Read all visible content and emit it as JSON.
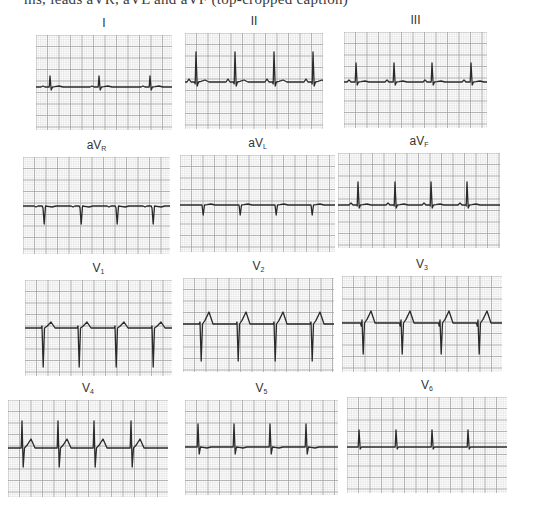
{
  "page": {
    "cut_text": "ms, leads aVR, aVL and aVF (top-cropped caption)"
  },
  "grid": {
    "minor_color": "#dcdcdc",
    "major_color": "#9c9c9c",
    "trace_color": "#2a2a2a",
    "minor_px": 2.3,
    "major_px": 11.5
  },
  "chart_data": {
    "type": "line",
    "xlabel": "time",
    "ylabel": "voltage",
    "grid": true,
    "layout": "4 rows x 3 columns",
    "leads": [
      {
        "id": "I",
        "label_main": "I",
        "label_sub": "",
        "box": [
          36,
          35,
          136,
          95
        ],
        "baseline": 52,
        "beats_x": [
          14,
          63,
          114,
          167
        ],
        "q": 0,
        "r": -11,
        "s": 3,
        "t": -1,
        "p": -1
      },
      {
        "id": "II",
        "label_main": "II",
        "label_sub": "",
        "box": [
          185,
          33,
          138,
          96
        ],
        "baseline": 49,
        "beats_x": [
          11,
          50,
          89,
          128
        ],
        "q": 2,
        "r": -30,
        "s": 4,
        "t": -2,
        "p": -3
      },
      {
        "id": "III",
        "label_main": "III",
        "label_sub": "",
        "box": [
          344,
          32,
          143,
          96
        ],
        "baseline": 50,
        "beats_x": [
          12,
          50,
          88,
          127
        ],
        "q": 0,
        "r": -19,
        "s": 3,
        "t": -1,
        "p": -2
      },
      {
        "id": "aVR",
        "label_main": "aV",
        "label_sub": "R",
        "box": [
          23,
          157,
          147,
          97
        ],
        "baseline": 49,
        "beats_x": [
          20,
          57,
          93,
          129
        ],
        "q": 0,
        "r": 2,
        "s": 18,
        "t": 1,
        "p": 1
      },
      {
        "id": "aVL",
        "label_main": "aV",
        "label_sub": "L",
        "box": [
          180,
          155,
          155,
          97
        ],
        "baseline": 50,
        "beats_x": [
          22,
          59,
          95,
          131
        ],
        "q": 0,
        "r": 0,
        "s": 10,
        "t": -1,
        "p": 0
      },
      {
        "id": "aVF",
        "label_main": "aV",
        "label_sub": "F",
        "box": [
          338,
          153,
          162,
          95
        ],
        "baseline": 52,
        "beats_x": [
          20,
          57,
          93,
          129
        ],
        "q": 1,
        "r": -23,
        "s": 3,
        "t": -1,
        "p": -2
      },
      {
        "id": "V1",
        "label_main": "V",
        "label_sub": "1",
        "box": [
          25,
          280,
          147,
          96
        ],
        "baseline": 48,
        "beats_x": [
          17,
          53,
          90,
          127
        ],
        "q": 0,
        "r": -2,
        "s": 39,
        "t": -6,
        "p": 0
      },
      {
        "id": "V2",
        "label_main": "V",
        "label_sub": "2",
        "box": [
          183,
          278,
          151,
          94
        ],
        "baseline": 46,
        "beats_x": [
          17,
          54,
          91,
          128
        ],
        "q": 0,
        "r": -2,
        "s": 37,
        "t": -12,
        "p": 0
      },
      {
        "id": "V3",
        "label_main": "V",
        "label_sub": "3",
        "box": [
          342,
          276,
          160,
          96
        ],
        "baseline": 47,
        "beats_x": [
          20,
          59,
          98,
          136
        ],
        "q": 3,
        "r": -3,
        "s": 31,
        "t": -12,
        "p": 0
      },
      {
        "id": "V4",
        "label_main": "V",
        "label_sub": "4",
        "box": [
          8,
          400,
          160,
          97
        ],
        "baseline": 48,
        "beats_x": [
          14,
          50,
          86,
          123
        ],
        "q": 0,
        "r": -27,
        "s": 19,
        "t": -9,
        "p": 0
      },
      {
        "id": "V5",
        "label_main": "V",
        "label_sub": "5",
        "box": [
          185,
          400,
          153,
          95
        ],
        "baseline": 47,
        "beats_x": [
          13,
          49,
          85,
          121
        ],
        "q": 0,
        "r": -23,
        "s": 7,
        "t": 1,
        "p": 0
      },
      {
        "id": "V6",
        "label_main": "V",
        "label_sub": "6",
        "box": [
          347,
          397,
          160,
          96
        ],
        "baseline": 50,
        "beats_x": [
          12,
          49,
          85,
          121
        ],
        "q": 0,
        "r": -17,
        "s": 2,
        "t": 0,
        "p": 0
      }
    ]
  }
}
